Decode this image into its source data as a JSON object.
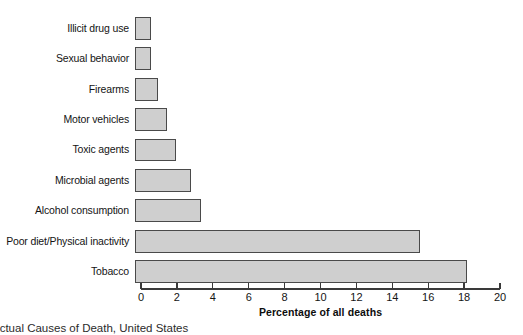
{
  "chart_data": {
    "type": "bar",
    "orientation": "horizontal",
    "title": "",
    "xlabel": "Percentage of all deaths",
    "ylabel": "",
    "xlim": [
      0,
      20
    ],
    "xticks": [
      0,
      2,
      4,
      6,
      8,
      10,
      12,
      14,
      16,
      18,
      20
    ],
    "xtick_labels": [
      "0",
      "2",
      "4",
      "6",
      "8",
      "10",
      "12",
      "14",
      "16",
      "18",
      "20"
    ],
    "grid": false,
    "legend": null,
    "categories": [
      "Illicit drug use",
      "Sexual behavior",
      "Firearms",
      "Motor vehicles",
      "Toxic agents",
      "Microbial agents",
      "Alcohol consumption",
      "Poor diet/Physical inactivity",
      "Tobacco"
    ],
    "values": [
      0.9,
      0.9,
      1.3,
      1.8,
      2.3,
      3.1,
      3.7,
      15.9,
      18.5
    ],
    "bar_fill_color": "#cfcfcf",
    "bar_border_color": "#4a4a4a",
    "axis_color": "#3a3a3a"
  },
  "caption": {
    "clipped_text": "Actual Causes of Death, United States"
  }
}
